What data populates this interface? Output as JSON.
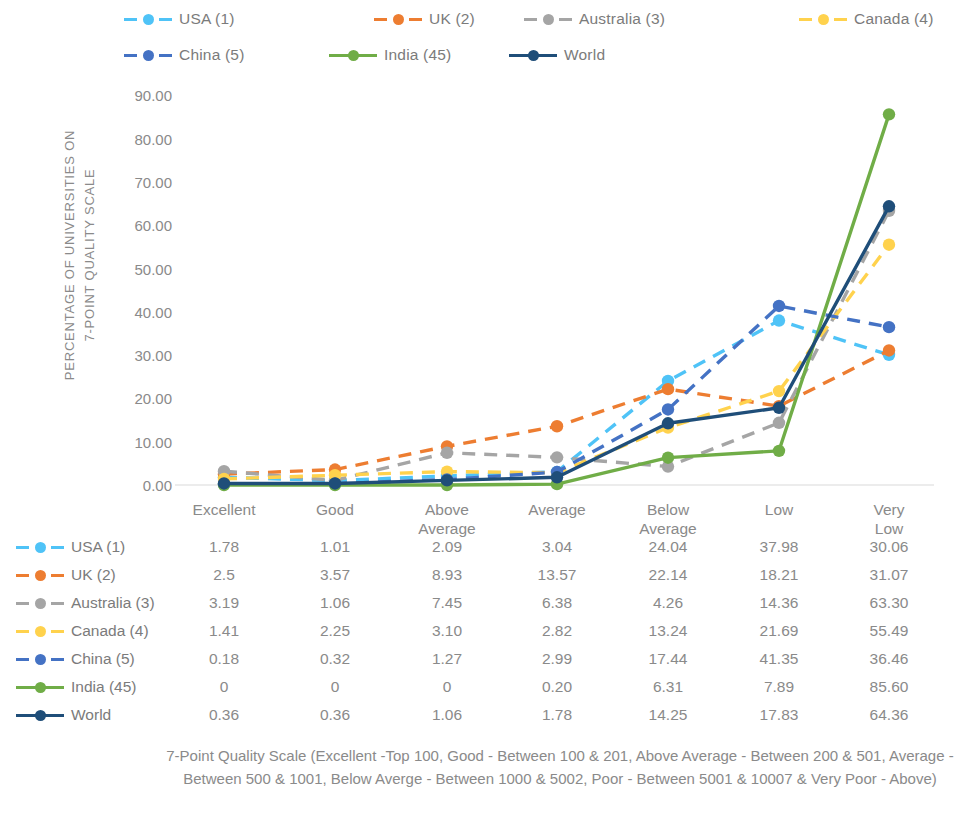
{
  "axis": {
    "y_title_line1": "PERCENTAGE OF UNIVERSITIES ON",
    "y_title_line2": "7-POINT QUALITY SCALE",
    "y_ticks": [
      "90.00",
      "80.00",
      "70.00",
      "60.00",
      "50.00",
      "40.00",
      "30.00",
      "20.00",
      "10.00",
      "0.00"
    ]
  },
  "caption": "7-Point Quality Scale (Excellent -Top 100, Good - Between 100 & 201, Above Average - Between 200 & 501, Average -  Between 500 & 1001, Below Averge - Between 1000 & 5002, Poor - Between 5001 & 10007 & Very Poor - Above)",
  "chart_data": {
    "type": "line",
    "title": "",
    "xlabel": "",
    "ylabel": "PERCENTAGE OF UNIVERSITIES ON 7-POINT QUALITY SCALE",
    "ylim": [
      0,
      90
    ],
    "grid": false,
    "legend_position": "top",
    "categories": [
      "Excellent",
      "Good",
      "Above Average",
      "Average",
      "Below Average",
      "Low",
      "Very Low"
    ],
    "series": [
      {
        "name": "USA (1)",
        "color": "#4FC3F7",
        "dash": "dashed",
        "values": [
          1.78,
          1.01,
          2.09,
          3.04,
          24.04,
          37.98,
          30.06
        ],
        "labels": [
          "1.78",
          "1.01",
          "2.09",
          "3.04",
          "24.04",
          "37.98",
          "30.06"
        ]
      },
      {
        "name": "UK (2)",
        "color": "#ED7D31",
        "dash": "dashed",
        "values": [
          2.5,
          3.57,
          8.93,
          13.57,
          22.14,
          18.21,
          31.07
        ],
        "labels": [
          "2.5",
          "3.57",
          "8.93",
          "13.57",
          "22.14",
          "18.21",
          "31.07"
        ]
      },
      {
        "name": "Australia (3)",
        "color": "#A5A5A5",
        "dash": "dashed",
        "values": [
          3.19,
          1.06,
          7.45,
          6.38,
          4.26,
          14.36,
          63.3
        ],
        "labels": [
          "3.19",
          "1.06",
          "7.45",
          "6.38",
          "4.26",
          "14.36",
          "63.30"
        ]
      },
      {
        "name": "Canada (4)",
        "color": "#FFD24D",
        "dash": "dashed",
        "values": [
          1.41,
          2.25,
          3.1,
          2.82,
          13.24,
          21.69,
          55.49
        ],
        "labels": [
          "1.41",
          "2.25",
          "3.10",
          "2.82",
          "13.24",
          "21.69",
          "55.49"
        ]
      },
      {
        "name": "China (5)",
        "color": "#4472C4",
        "dash": "dashed",
        "values": [
          0.18,
          0.32,
          1.27,
          2.99,
          17.44,
          41.35,
          36.46
        ],
        "labels": [
          "0.18",
          "0.32",
          "1.27",
          "2.99",
          "17.44",
          "41.35",
          "36.46"
        ]
      },
      {
        "name": "India (45)",
        "color": "#70AD47",
        "dash": "solid",
        "values": [
          0,
          0,
          0,
          0.2,
          6.31,
          7.89,
          85.6
        ],
        "labels": [
          "0",
          "0",
          "0",
          "0.20",
          "6.31",
          "7.89",
          "85.60"
        ]
      },
      {
        "name": "World",
        "color": "#1F4E79",
        "dash": "solid",
        "values": [
          0.36,
          0.36,
          1.06,
          1.78,
          14.25,
          17.83,
          64.36
        ],
        "labels": [
          "0.36",
          "0.36",
          "1.06",
          "1.78",
          "14.25",
          "17.83",
          "64.36"
        ]
      }
    ]
  }
}
